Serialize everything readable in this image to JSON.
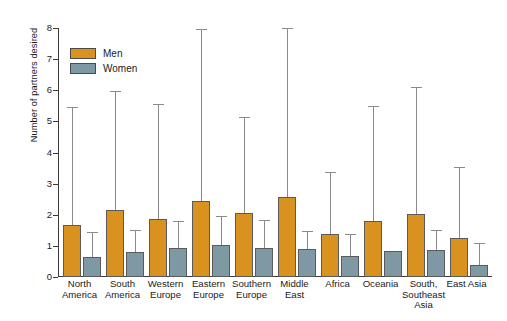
{
  "chart_data": {
    "type": "bar",
    "title": "",
    "xlabel": "",
    "ylabel": "Number of partners desired",
    "ylim": [
      0,
      8
    ],
    "yticks": [
      0,
      1,
      2,
      3,
      4,
      5,
      6,
      7,
      8
    ],
    "grid": false,
    "legend_position": "top-left",
    "error_bars": "upper only (standard deviation)",
    "categories": [
      "North\nAmerica",
      "South\nAmerica",
      "Western\nEurope",
      "Eastern\nEurope",
      "Southern\nEurope",
      "Middle\nEast",
      "Africa",
      "Oceania",
      "South,\nSoutheast\nAsia",
      "East Asia"
    ],
    "series": [
      {
        "name": "Men",
        "color": "#D9911F",
        "values": [
          1.68,
          2.14,
          1.86,
          2.45,
          2.06,
          2.58,
          1.37,
          1.8,
          2.04,
          1.26
        ],
        "error_upper": [
          5.42,
          5.95,
          5.52,
          7.95,
          5.1,
          7.97,
          3.34,
          5.47,
          6.08,
          3.5
        ]
      },
      {
        "name": "Women",
        "color": "#7E99A3",
        "values": [
          0.65,
          0.8,
          0.93,
          1.02,
          0.92,
          0.9,
          0.66,
          0.84,
          0.88,
          0.38
        ],
        "error_upper": [
          1.42,
          1.48,
          1.77,
          1.92,
          1.81,
          1.45,
          1.34,
          0.84,
          1.47,
          1.07
        ]
      }
    ]
  },
  "legend": {
    "items": [
      {
        "label": "Men",
        "color": "#D9911F"
      },
      {
        "label": "Women",
        "color": "#7E99A3"
      }
    ]
  }
}
